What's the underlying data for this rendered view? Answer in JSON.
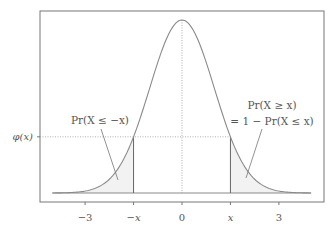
{
  "chart_data": {
    "type": "area",
    "title": "",
    "xlabel": "",
    "ylabel": "",
    "xlim": [
      -4,
      4
    ],
    "ylim": [
      0,
      0.4
    ],
    "grid": false,
    "series": [
      {
        "name": "phi",
        "function": "standard normal pdf",
        "x_range": [
          -4,
          4
        ]
      }
    ],
    "x_ticks": [
      {
        "value": -3,
        "label": "−3"
      },
      {
        "value": -1.5,
        "label": "−x"
      },
      {
        "value": 0,
        "label": "0"
      },
      {
        "value": 1.5,
        "label": "x"
      },
      {
        "value": 3,
        "label": "3"
      }
    ],
    "y_ticks": [
      {
        "value": 0.1295,
        "label": "φ(x)"
      }
    ],
    "marker_x": 1.5,
    "shaded_regions": [
      {
        "from": -4,
        "to": -1.5,
        "label": "Pr(X ≤ −x)"
      },
      {
        "from": 1.5,
        "to": 4,
        "label": "Pr(X ≥ x) = 1 − Pr(X ≤ x)"
      }
    ],
    "annotations": {
      "left_label": "Pr(X ≤ −x)",
      "right_label_line1": "Pr(X ≥ x)",
      "right_label_line2": "= 1 − Pr(X ≤ x)"
    },
    "colors": {
      "curve": "#8a8a8a",
      "frame": "#777777",
      "shade": "#f2f2f2",
      "reference_lines": "#9a9a9a",
      "text": "#555555"
    }
  }
}
